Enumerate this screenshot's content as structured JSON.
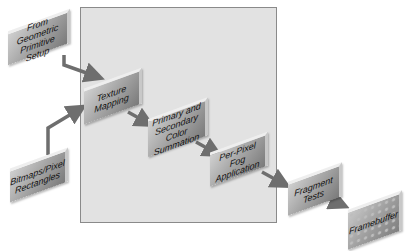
{
  "diagram": {
    "title": "",
    "region": {
      "label": "",
      "fill": "#e2e2e2",
      "stroke": "#8a8a8a"
    },
    "nodes": [
      {
        "id": "geometric",
        "label": "From Geometric Primitive Setup"
      },
      {
        "id": "bitmaps",
        "label": "Bitmaps/Pixel Rectangles"
      },
      {
        "id": "texture",
        "label": "Texture Mapping"
      },
      {
        "id": "color_sum",
        "label": "Primary and Secondary Color Summation"
      },
      {
        "id": "fog",
        "label": "Per-Pixel Fog Application"
      },
      {
        "id": "fragment",
        "label": "Fragment Tests"
      },
      {
        "id": "framebuffer",
        "label": "Framebuffer"
      }
    ],
    "edges": [
      {
        "from": "geometric",
        "to": "texture"
      },
      {
        "from": "bitmaps",
        "to": "texture"
      },
      {
        "from": "texture",
        "to": "color_sum"
      },
      {
        "from": "color_sum",
        "to": "fog"
      },
      {
        "from": "fog",
        "to": "fragment"
      },
      {
        "from": "fragment",
        "to": "framebuffer"
      }
    ],
    "colors": {
      "arrow": "#6e6e6e",
      "box_light": "#d0d0d0",
      "box_dark": "#7a7a7a"
    }
  }
}
